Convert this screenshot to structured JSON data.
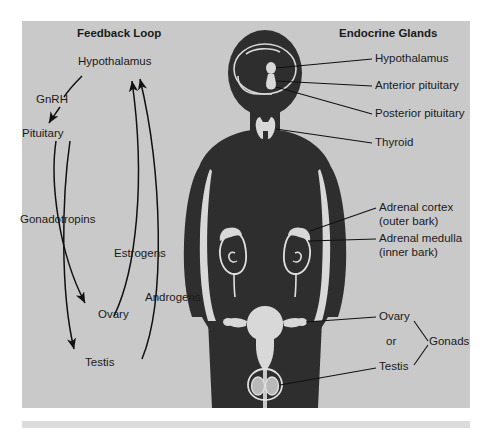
{
  "figure": {
    "background_color": "#c9c9c9",
    "body_color": "#2e2e2e",
    "gland_color": "#d2d2d2",
    "line_color": "#111111",
    "panels": {
      "left_title": "Feedback Loop",
      "right_title": "Endocrine Glands"
    }
  },
  "feedback_loop": {
    "title": "Feedback Loop",
    "nodes": [
      {
        "id": "hypothalamus",
        "label": "Hypothalamus"
      },
      {
        "id": "pituitary",
        "label": "Pituitary"
      },
      {
        "id": "ovary",
        "label": "Ovary"
      },
      {
        "id": "testis",
        "label": "Testis"
      }
    ],
    "edge_labels": [
      {
        "id": "gnrh",
        "label": "GnRH"
      },
      {
        "id": "gonadotropins",
        "label": "Gonadotropins"
      },
      {
        "id": "estrogens",
        "label": "Estrogens"
      },
      {
        "id": "androgens",
        "label": "Androgens"
      }
    ]
  },
  "endocrine_glands": {
    "title": "Endocrine Glands",
    "labels": [
      {
        "id": "hypothalamus",
        "line1": "Hypothalamus",
        "line2": ""
      },
      {
        "id": "anterior-pituitary",
        "line1": "Anterior pituitary",
        "line2": ""
      },
      {
        "id": "posterior-pituitary",
        "line1": "Posterior pituitary",
        "line2": ""
      },
      {
        "id": "thyroid",
        "line1": "Thyroid",
        "line2": ""
      },
      {
        "id": "adrenal-cortex",
        "line1": "Adrenal cortex",
        "line2": "(outer bark)"
      },
      {
        "id": "adrenal-medulla",
        "line1": "Adrenal medulla",
        "line2": "(inner bark)"
      },
      {
        "id": "ovary",
        "line1": "Ovary",
        "line2": ""
      },
      {
        "id": "or",
        "line1": "or",
        "line2": ""
      },
      {
        "id": "testis",
        "line1": "Testis",
        "line2": ""
      },
      {
        "id": "gonads",
        "line1": "Gonads",
        "line2": ""
      }
    ]
  }
}
